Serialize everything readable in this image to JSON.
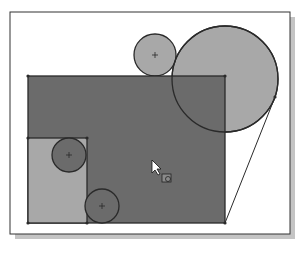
{
  "viewport": {
    "frame": {
      "x": 10,
      "y": 12,
      "w": 280,
      "h": 222,
      "stroke": "#333333",
      "fill": "#ffffff"
    },
    "shadow": {
      "color": "#c4c4c4"
    }
  },
  "colors": {
    "dark_fill": "#6b6b6b",
    "medium_fill": "#9a9a9a",
    "light_fill": "#a8a8a8",
    "stroke": "#2a2a2a"
  },
  "shapes": {
    "main_rect": {
      "x": 28,
      "y": 76,
      "w": 197,
      "h": 147
    },
    "inner_rect": {
      "x": 28,
      "y": 138,
      "w": 59,
      "h": 85
    },
    "circle_top_small": {
      "cx": 155,
      "cy": 55,
      "r": 21
    },
    "circle_large": {
      "cx": 225,
      "cy": 79,
      "r": 53
    },
    "circle_left": {
      "cx": 69,
      "cy": 155,
      "r": 17
    },
    "circle_bottom": {
      "cx": 102,
      "cy": 206,
      "r": 17
    },
    "tangent_line": {
      "x1": 225,
      "y1": 223,
      "x2": 275,
      "y2": 97
    }
  },
  "cursor": {
    "x": 152,
    "y": 160,
    "icon": "select-cursor-icon"
  }
}
